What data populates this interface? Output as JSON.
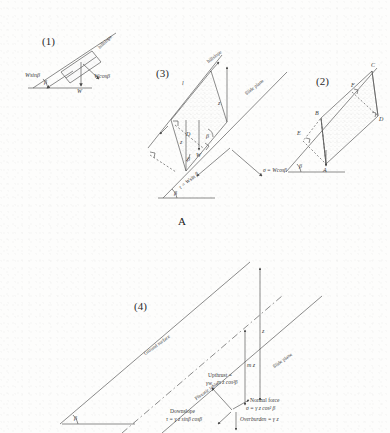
{
  "figure": {
    "caption_A": "A",
    "background_color": "#fdfdfc",
    "line_color": "#5a5a5a",
    "text_color": "#3a3a3a"
  },
  "panels": [
    {
      "id": "panel-1",
      "number": "(1)",
      "labels": {
        "slope_line": "hillslope",
        "force_down_slope": "Wsinβ",
        "force_weight": "W",
        "force_normal": "Wcosβ",
        "angle": "β"
      }
    },
    {
      "id": "panel-3",
      "number": "(3)",
      "labels": {
        "slope_line": "hillslope",
        "slide_plane": "Slide plane",
        "length_l": "l",
        "depth_z": "z",
        "dim_D": "D",
        "dim_z_left": "z",
        "weight": "W",
        "angle_beta_inner": "β",
        "angle_beta_lower": "β",
        "angle_beta_base": "β",
        "shear_stress": "τ = Wsin β",
        "normal_stress": "σ = Wcosβ"
      }
    },
    {
      "id": "panel-2",
      "number": "(2)",
      "labels": {
        "vertex_a": "A",
        "vertex_b": "B",
        "vertex_c": "C",
        "vertex_d": "D",
        "vertex_e": "E",
        "vertex_f": "F",
        "angle": "β"
      }
    },
    {
      "id": "panel-4",
      "number": "(4)",
      "labels": {
        "ground_surface": "Ground surface",
        "phreatic_table": "Phreatic table",
        "slide_plane": "Slide plane",
        "depth_z": "z",
        "depth_mz": "m z",
        "angle": "β",
        "upthrust_title": "Upthrust =",
        "upthrust_gamma": "γw",
        "upthrust_expr": "m z cos²β",
        "normal_force_title": "Normal force",
        "normal_force_expr": "σ = γ z cos² β",
        "overburden_expr": "Overburden = γ z",
        "downslope_title": "Downslope",
        "downslope_expr": "τ = γ z sinβ cosβ"
      }
    }
  ]
}
